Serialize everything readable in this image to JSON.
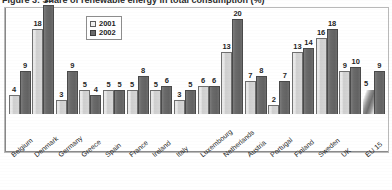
{
  "title": {
    "text": "Figure 3: Share of renewable energy in total consumption (%)",
    "clipped": true
  },
  "legend": {
    "position": "top-center-left",
    "entries": [
      {
        "label": "2001",
        "swatch": "light-gray-square",
        "color": "#e8e8e8"
      },
      {
        "label": "2002",
        "swatch": "dark-gray-square",
        "color": "#6b6b6b"
      }
    ]
  },
  "chart_data": {
    "type": "bar",
    "title": "",
    "xlabel": "",
    "ylabel": "",
    "ylim": [
      0,
      24
    ],
    "grid": false,
    "legend_position": "top-center",
    "categories": [
      "Belgium",
      "Denmark",
      "Germany",
      "Greece",
      "Spain",
      "France",
      "Ireland",
      "Italy",
      "Luxembourg",
      "Netherlands",
      "Austria",
      "Portugal",
      "Finland",
      "Sweden",
      "UK",
      "EU 15"
    ],
    "series": [
      {
        "name": "2001",
        "color": "#e8e8e8",
        "values": [
          4,
          18,
          3,
          5,
          5,
          5,
          5,
          3,
          6,
          13,
          7,
          2,
          13,
          16,
          9,
          5
        ]
      },
      {
        "name": "2002",
        "color": "#6b6b6b",
        "values": [
          9,
          23,
          9,
          4,
          5,
          8,
          6,
          5,
          6,
          20,
          8,
          7,
          14,
          18,
          10,
          9
        ]
      }
    ]
  },
  "axis": {
    "tick_labels": [
      "Belgium",
      "Denmark",
      "Germany",
      "Greece",
      "Spain",
      "France",
      "Ireland",
      "Italy",
      "Luxembourg",
      "Netherlands",
      "Austria",
      "Portugal",
      "Finland",
      "Sweden",
      "UK",
      "EU 15"
    ],
    "rotation_degrees": -40
  },
  "colors": {
    "series_2001": "#e8e8e8",
    "series_2002": "#6b6b6b",
    "frame": "#b9b9b9",
    "axis": "#8a8a8a",
    "text": "#1f1f1f",
    "background": "#ffffff"
  }
}
